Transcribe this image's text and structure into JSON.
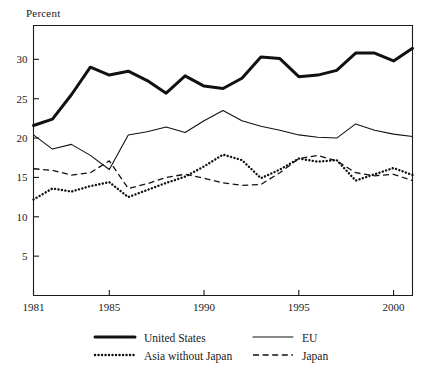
{
  "chart_data": {
    "type": "line",
    "title": "",
    "subtitle": "",
    "xlabel": "",
    "ylabel": "Percent",
    "xlim": [
      1981,
      2001
    ],
    "ylim": [
      0,
      34.3
    ],
    "grid": false,
    "legend_position": "bottom",
    "x_tick_labels": [
      "1981",
      "1985",
      "1990",
      "1995",
      "2000"
    ],
    "x_ticks": [
      1981,
      1985,
      1990,
      1995,
      2000
    ],
    "y_tick_labels": [
      "5",
      "10",
      "15",
      "20",
      "25",
      "30"
    ],
    "y_ticks": [
      5,
      10,
      15,
      20,
      25,
      30
    ],
    "x": [
      1981,
      1982,
      1983,
      1984,
      1985,
      1986,
      1987,
      1988,
      1989,
      1990,
      1991,
      1992,
      1993,
      1994,
      1995,
      1996,
      1997,
      1998,
      1999,
      2000,
      2001
    ],
    "series": [
      {
        "name": "United States",
        "style": "thick-solid",
        "values": [
          21.6,
          22.4,
          25.5,
          29.0,
          28.0,
          28.5,
          27.3,
          25.7,
          27.9,
          26.6,
          26.3,
          27.6,
          30.3,
          30.1,
          27.8,
          28.0,
          28.6,
          30.8,
          30.8,
          29.8,
          31.4
        ]
      },
      {
        "name": "EU",
        "style": "thin-solid",
        "values": [
          20.4,
          18.6,
          19.2,
          17.8,
          16.0,
          20.4,
          20.8,
          21.4,
          20.7,
          22.2,
          23.5,
          22.2,
          21.5,
          21.0,
          20.4,
          20.1,
          20.0,
          21.8,
          21.0,
          20.5,
          20.2
        ]
      },
      {
        "name": "Asia without Japan",
        "style": "dotted",
        "values": [
          12.2,
          13.6,
          13.2,
          13.9,
          14.4,
          12.5,
          13.4,
          14.3,
          15.1,
          16.4,
          17.9,
          17.2,
          14.9,
          16.0,
          17.4,
          17.0,
          17.2,
          14.6,
          15.4,
          16.2,
          15.3
        ]
      },
      {
        "name": "Japan",
        "style": "dashed",
        "values": [
          16.1,
          15.9,
          15.3,
          15.6,
          17.1,
          13.6,
          14.2,
          15.0,
          15.4,
          14.9,
          14.3,
          14.0,
          14.1,
          15.6,
          17.4,
          17.8,
          17.1,
          15.6,
          15.2,
          15.4,
          14.6
        ]
      }
    ],
    "legend": [
      {
        "label": "United States",
        "style": "thick-solid"
      },
      {
        "label": "EU",
        "style": "thin-solid"
      },
      {
        "label": "Asia without Japan",
        "style": "dotted"
      },
      {
        "label": "Japan",
        "style": "dashed"
      }
    ],
    "colors": {
      "line": "#111111",
      "axis": "#1a1a1a",
      "background": "#ffffff"
    }
  }
}
